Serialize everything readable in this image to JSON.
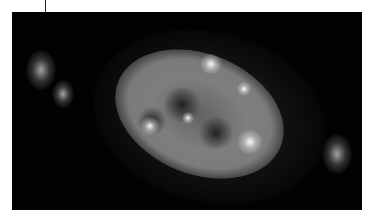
{
  "image": {
    "description": "Grayscale astronomical image of a planetary nebula with bright irregular shell and two faint outer lobes on a black background",
    "colors": {
      "background": "#020202",
      "border": "#ffffff",
      "nebula": "#d0d0d0"
    }
  }
}
